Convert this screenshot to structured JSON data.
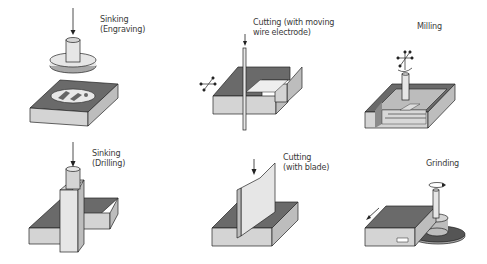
{
  "diagram": {
    "title": "",
    "processes": [
      {
        "id": "sinking-engraving",
        "label": "Sinking\n(Engraving)"
      },
      {
        "id": "cutting-wire",
        "label": "Cutting (with moving\nwire electrode)"
      },
      {
        "id": "milling",
        "label": "Milling"
      },
      {
        "id": "sinking-drilling",
        "label": "Sinking\n(Drilling)"
      },
      {
        "id": "cutting-blade",
        "label": "Cutting\n(with blade)"
      },
      {
        "id": "grinding",
        "label": "Grinding"
      }
    ],
    "colors": {
      "background": "#ffffff",
      "top_face": "#6a6a6a",
      "front_face": "#d4d4d4",
      "side_face": "#bdbdbd",
      "outline": "#222222"
    }
  }
}
